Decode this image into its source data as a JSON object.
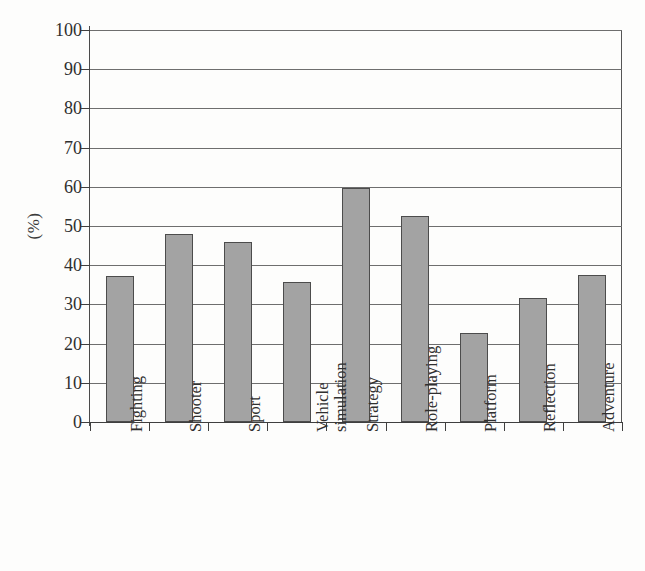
{
  "chart_data": {
    "type": "bar",
    "title": "",
    "xlabel": "",
    "ylabel": "(%)",
    "ylim": [
      0,
      100
    ],
    "ytick_step": 10,
    "grid": true,
    "legend": false,
    "bar_color": "#a3a3a3",
    "bar_edge_color": "#4c4c4c",
    "categories": [
      "Fighting",
      "Shooter",
      "Sport",
      "Vehicle\nsimulation",
      "Strategy",
      "Role-playing",
      "Platform",
      "Reflection",
      "Adventure"
    ],
    "values": [
      37.2,
      48.0,
      46.0,
      35.7,
      59.8,
      52.6,
      22.6,
      31.6,
      37.6
    ],
    "ytick_labels": [
      "100",
      "90",
      "80",
      "70",
      "60",
      "50",
      "40",
      "30",
      "20",
      "10",
      "0"
    ],
    "ytick_values": [
      100,
      90,
      80,
      70,
      60,
      50,
      40,
      30,
      20,
      10,
      0
    ]
  }
}
